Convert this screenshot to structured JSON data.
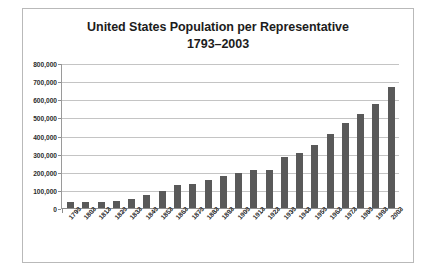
{
  "chart_data": {
    "type": "bar",
    "title": "United States Population per Representative",
    "subtitle": "1793–2003",
    "title_lines": [
      "United States Population per Representative",
      "1793–2003"
    ],
    "xlabel": "",
    "ylabel": "",
    "ylim": [
      0,
      800000
    ],
    "ytick_step": 100000,
    "grid": true,
    "legend": false,
    "bar_color": "#595959",
    "gridline_color": "#c4c4c4",
    "axis_color": "#8d8d8d",
    "border_color": "#b9b9b9",
    "background_color": "#ffffff",
    "ytick_labels": [
      "800,000",
      "700,000",
      "600,000",
      "500,000",
      "400,000",
      "300,000",
      "200,000",
      "100,000",
      "0"
    ],
    "ytick_values": [
      800000,
      700000,
      600000,
      500000,
      400000,
      300000,
      200000,
      100000,
      0
    ],
    "categories": [
      "1793",
      "1803",
      "1813",
      "1823",
      "1833",
      "1843",
      "1853",
      "1863",
      "1873",
      "1883",
      "1893",
      "1903",
      "1913",
      "1923",
      "1933",
      "1943",
      "1953",
      "1963",
      "1973",
      "1983",
      "1993",
      "2003"
    ],
    "values": [
      34000,
      34000,
      35000,
      41000,
      48000,
      71000,
      93000,
      127000,
      131000,
      152000,
      174000,
      194000,
      212000,
      212000,
      280000,
      301000,
      345000,
      410000,
      470000,
      520000,
      575000,
      665000
    ]
  }
}
